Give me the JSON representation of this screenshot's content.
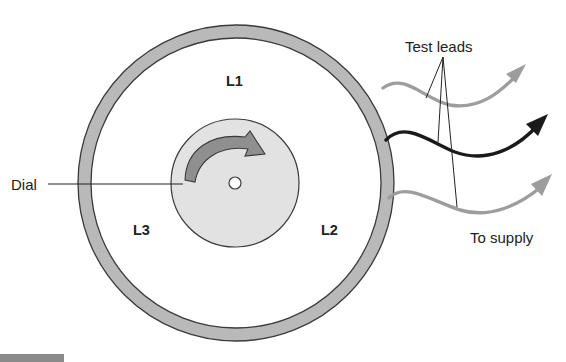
{
  "diagram": {
    "type": "dial-meter-schematic",
    "labels": {
      "l1": "L1",
      "l2": "L2",
      "l3": "L3",
      "dial": "Dial",
      "test_leads": "Test leads",
      "to_supply": "To supply"
    },
    "colors": {
      "background": "#ffffff",
      "outer_ring_fill": "#b9b9b9",
      "outline": "#3a3a3a",
      "dial_fill": "#e2e2e2",
      "rotation_arrow_fill": "#8f8f8f",
      "gray_lead": "#9d9d9d",
      "black_lead": "#1a1a1a",
      "leader_line": "#222222",
      "text": "#222222"
    },
    "components": {
      "outer_ring": {
        "label": "meter housing"
      },
      "dial": {
        "label": "Dial",
        "rotation": "clockwise"
      },
      "leads": [
        {
          "name": "lead-top",
          "color": "gray"
        },
        {
          "name": "lead-middle",
          "color": "black"
        },
        {
          "name": "lead-bottom",
          "color": "gray"
        }
      ]
    }
  }
}
